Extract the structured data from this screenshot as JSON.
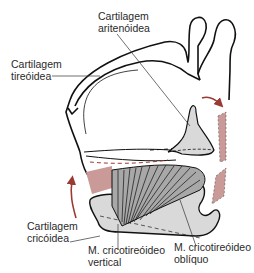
{
  "figure": {
    "colors": {
      "outline": "#111111",
      "cartilage_fill": "#d9d9d9",
      "muscle_fill": "#a8a8a8",
      "ligament_fill": "#c99a97",
      "arrow": "#9b3a33",
      "leader": "#333333"
    },
    "labels": {
      "arytenoid": {
        "line1": "Cartilagem",
        "line2": "aritenóidea"
      },
      "thyroid": {
        "line1": "Cartilagem",
        "line2": "tireóidea"
      },
      "cricoid": {
        "line1": "Cartilagem",
        "line2": "cricóidea"
      },
      "ct_vertical": {
        "line1": "M. cricotireóideo",
        "line2": "vertical"
      },
      "ct_oblique": {
        "line1": "M. cricotireóideo",
        "line2": "oblíquo"
      }
    },
    "arrows": [
      {
        "name": "cricoid-rotation-arrow",
        "direction": "up"
      },
      {
        "name": "thyroid-tilt-arrow",
        "direction": "right-down"
      }
    ]
  }
}
